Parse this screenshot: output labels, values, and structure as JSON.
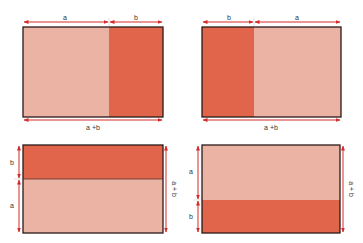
{
  "colors": {
    "light": "#eab3a3",
    "dark": "#e0654b",
    "border": "#2a1a1a",
    "arrow": "#d62a2a"
  },
  "panels": [
    {
      "id": "top-left",
      "orientation": "horizontal",
      "segments": [
        {
          "label": "a",
          "shade": "light"
        },
        {
          "label": "b",
          "shade": "dark"
        }
      ],
      "total_label": "a +b"
    },
    {
      "id": "top-right",
      "orientation": "horizontal",
      "segments": [
        {
          "label": "b",
          "shade": "dark"
        },
        {
          "label": "a",
          "shade": "light"
        }
      ],
      "total_label": "a +b"
    },
    {
      "id": "bottom-left",
      "orientation": "vertical",
      "segments": [
        {
          "label": "b",
          "shade": "dark"
        },
        {
          "label": "a",
          "shade": "light"
        }
      ],
      "total_label": "a + b"
    },
    {
      "id": "bottom-right",
      "orientation": "vertical",
      "segments": [
        {
          "label": "a",
          "shade": "light"
        },
        {
          "label": "b",
          "shade": "dark"
        }
      ],
      "total_label": "a + b"
    }
  ]
}
